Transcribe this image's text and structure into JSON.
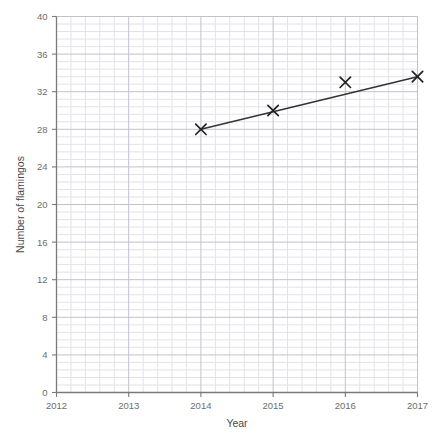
{
  "chart_data": {
    "type": "scatter",
    "title": "",
    "xlabel": "Year",
    "ylabel": "Number of flamingos",
    "x": [
      2014,
      2015,
      2016,
      2017
    ],
    "values": [
      28,
      30,
      33,
      33.6
    ],
    "series": [
      {
        "name": "Number of flamingos",
        "values": [
          28,
          30,
          33,
          33.6
        ],
        "marker": "x"
      }
    ],
    "trend_line": {
      "x": [
        2014,
        2017
      ],
      "y": [
        28,
        33.6
      ]
    },
    "xlim": [
      2012,
      2017
    ],
    "ylim": [
      0,
      40
    ],
    "x_ticks": [
      2012,
      2013,
      2014,
      2015,
      2016,
      2017
    ],
    "x_tick_labels": [
      "2012",
      "2013",
      "2014",
      "2015",
      "2016",
      "2017"
    ],
    "y_ticks": [
      0,
      4,
      8,
      12,
      16,
      20,
      24,
      28,
      32,
      36,
      40
    ],
    "y_tick_labels": [
      "0",
      "4",
      "8",
      "12",
      "16",
      "20",
      "24",
      "28",
      "32",
      "36",
      "40"
    ],
    "grid": true,
    "grid_minor": true,
    "minor_per_major": 5,
    "legend": "none",
    "colors": {
      "line": "#333333",
      "marker": "#222222",
      "axis": "#7a7a7a",
      "grid_major": "#c2c2cc",
      "grid_minor": "#e2e2ea",
      "background": "#ffffff",
      "text": "#5a5a5a"
    }
  }
}
